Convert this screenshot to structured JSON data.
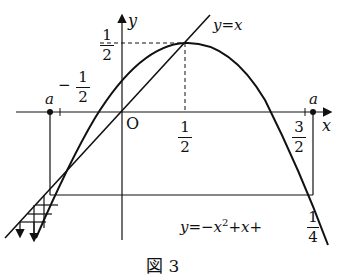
{
  "diagram": {
    "caption": "図 3",
    "axes": {
      "x_label": "x",
      "y_label": "y",
      "origin_label": "O"
    },
    "curves": {
      "line_label": "y=x",
      "parabola_label_prefix": "y=−x",
      "parabola_label_exp": "2",
      "parabola_label_mid": "+x+",
      "parabola_const_num": "1",
      "parabola_const_den": "4"
    },
    "ticks": {
      "y_half": {
        "num": "1",
        "den": "2"
      },
      "neg_half": {
        "sign": "−",
        "num": "1",
        "den": "2"
      },
      "x_half": {
        "num": "1",
        "den": "2"
      },
      "x_three_half": {
        "num": "3",
        "den": "2"
      }
    },
    "points": {
      "left_a": "a",
      "right_a": "a"
    },
    "colors": {
      "ink": "#111111",
      "background": "#ffffff"
    }
  }
}
